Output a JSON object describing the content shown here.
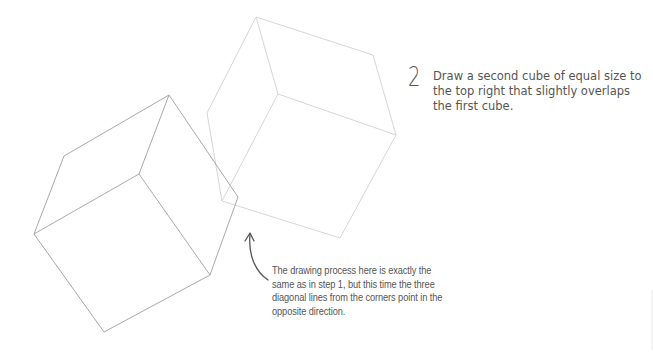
{
  "step": {
    "number": "2",
    "instruction": "Draw a second cube of equal size to the top right that slightly overlaps the first cube."
  },
  "annotation": {
    "text": "The drawing process here is exactly the same as in step 1, but this time the three diagonal lines from the corners point in the opposite direction."
  },
  "icons": {
    "arrow": "curved-up-arrow-icon"
  },
  "colors": {
    "cube1_stroke": "#a8a8a8",
    "cube2_stroke": "#d4d4d4",
    "text": "#555555",
    "background": "#ffffff"
  },
  "cubes": [
    {
      "name": "first-cube",
      "outer": [
        [
          169,
          95
        ],
        [
          238,
          197
        ],
        [
          210,
          275
        ],
        [
          104,
          332
        ],
        [
          34,
          234
        ],
        [
          64,
          156
        ]
      ],
      "inner": [
        139,
        174
      ],
      "spokes_to": [
        [
          169,
          95
        ],
        [
          210,
          275
        ],
        [
          34,
          234
        ]
      ]
    },
    {
      "name": "second-cube",
      "outer": [
        [
          256,
          17
        ],
        [
          373,
          55
        ],
        [
          396,
          135
        ],
        [
          340,
          238
        ],
        [
          222,
          201
        ],
        [
          207,
          113
        ]
      ],
      "inner": [
        278,
        94
      ],
      "spokes_to": [
        [
          256,
          17
        ],
        [
          396,
          135
        ],
        [
          222,
          201
        ]
      ]
    }
  ]
}
